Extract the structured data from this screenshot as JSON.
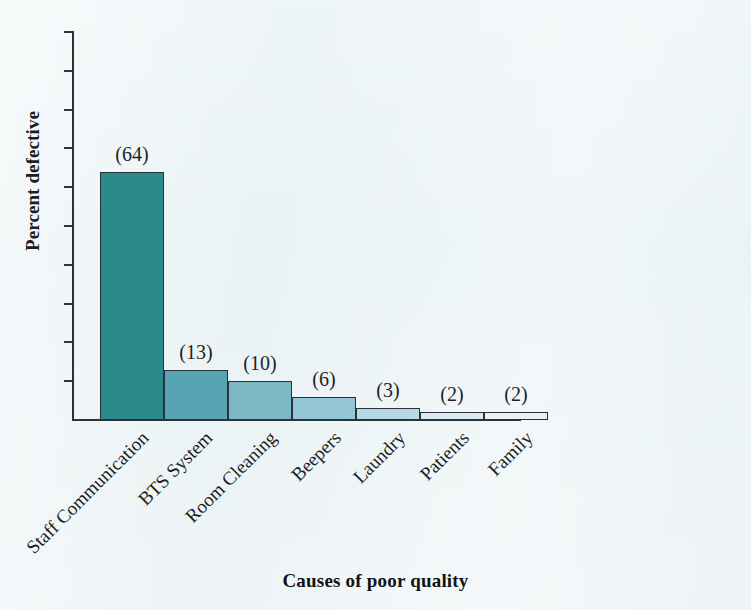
{
  "chart_data": {
    "type": "bar",
    "title": "",
    "subtitle": "",
    "xlabel": "Causes of poor quality",
    "ylabel": "Percent defective",
    "categories": [
      "Staff Communication",
      "BTS System",
      "Room Cleaning",
      "Beepers",
      "Laundry",
      "Patients",
      "Family"
    ],
    "values": [
      64,
      13,
      10,
      6,
      3,
      2,
      2
    ],
    "point_labels": [
      "(64)",
      "(13)",
      "(10)",
      "(6)",
      "(3)",
      "(2)",
      "(2)"
    ],
    "ylim": [
      0,
      100
    ],
    "xlim_note": "categorical, 7 adjacent bars, no gaps",
    "ytick_values": [
      0,
      10,
      20,
      30,
      40,
      50,
      60,
      70,
      80,
      90,
      100
    ],
    "ytick_labels": [
      "0",
      "10",
      "20",
      "30",
      "40",
      "50",
      "60",
      "70",
      "80",
      "90",
      "100%"
    ],
    "grid": false,
    "legend": null,
    "legend_position": "none",
    "bar_colors": [
      "#2c8a8d",
      "#57a5b3",
      "#7cb8c6",
      "#93c6d6",
      "#b6d9e6",
      "#dceaf1",
      "#e7f1f6"
    ],
    "bar_edge_color": "#2a3237",
    "axis_color": "#2c3136",
    "text_color": "#1d1d1d",
    "background_color": "#eef4f6",
    "xtick_label_rotation_degrees": -45
  }
}
